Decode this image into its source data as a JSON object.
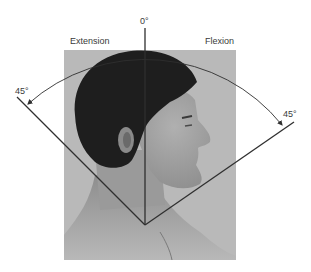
{
  "figure": {
    "labels": {
      "zero": "0°",
      "extension": "Extension",
      "flexion": "Flexion",
      "left_angle": "45°",
      "right_angle": "45°"
    },
    "colors": {
      "photo_background": "#b9b9b9",
      "line": "#2f2f2f",
      "hair": "#1e1e1e",
      "skin_face": "#9d9d9d",
      "skin_neck": "#a8a8a8",
      "text": "#3a3a3a"
    }
  }
}
